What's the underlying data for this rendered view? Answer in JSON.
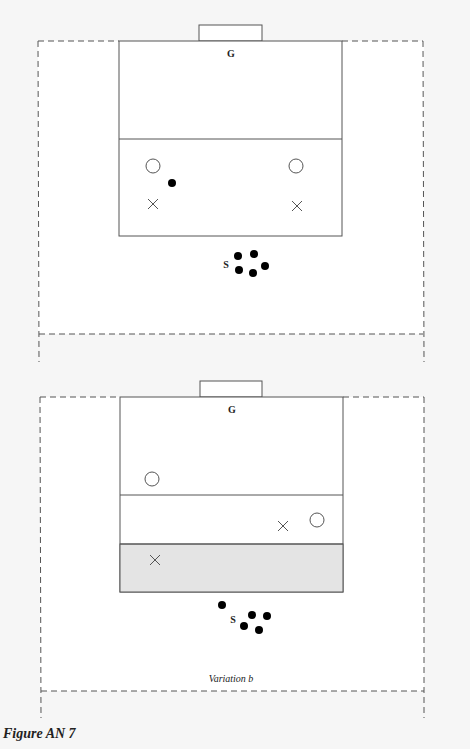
{
  "caption": "Figure AN 7",
  "diagrams": [
    {
      "id": "top",
      "goal_label": "G",
      "server_label": "S",
      "subtitle": ""
    },
    {
      "id": "variation-b",
      "goal_label": "G",
      "server_label": "S",
      "subtitle": "Variation b"
    }
  ],
  "legend_semantics": {
    "open_circle": "attacker",
    "cross": "defender",
    "solid_dot": "ball / player in queue"
  },
  "colors": {
    "line": "#555555",
    "dash": "#555555",
    "shaded_zone": "#e4e4e4",
    "dot": "#000000"
  }
}
